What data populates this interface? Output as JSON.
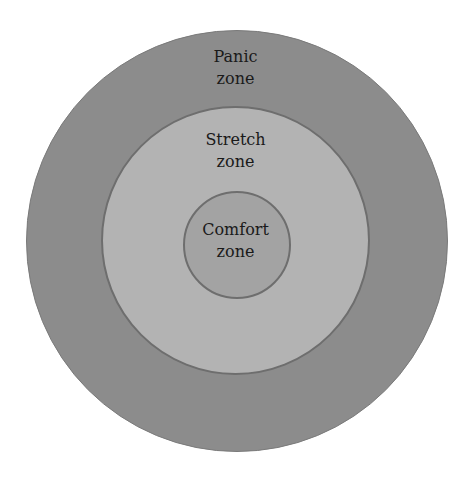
{
  "diagram": {
    "type": "concentric-circles",
    "zones": [
      {
        "id": "panic",
        "line1": "Panic",
        "line2": "zone",
        "fill": "#8c8c8c",
        "border": "#7a7a7a",
        "center": [
          236.5,
          241
        ],
        "radius": 211
      },
      {
        "id": "stretch",
        "line1": "Stretch",
        "line2": "zone",
        "fill": "#b3b3b3",
        "border": "#6e6e6e",
        "center": [
          235.5,
          240
        ],
        "radius": 134.5
      },
      {
        "id": "comfort",
        "line1": "Comfort",
        "line2": "zone",
        "fill": "#a3a3a3",
        "border": "#6e6e6e",
        "center": [
          236.5,
          245
        ],
        "radius": 54
      }
    ]
  }
}
